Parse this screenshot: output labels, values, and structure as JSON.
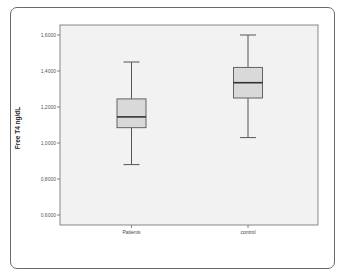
{
  "chart_data": {
    "type": "boxplot",
    "title": "",
    "xlabel": "",
    "ylabel": "Free T4 ng/dL",
    "ylim": [
      0.56,
      1.66
    ],
    "yticks": [
      0.6,
      0.8,
      1.0,
      1.2,
      1.4,
      1.6
    ],
    "ytick_labels": [
      "0,6000",
      "0,8000",
      "1,0000",
      "1,2000",
      "1,4000",
      "1,6000"
    ],
    "categories": [
      "Patients",
      "control"
    ],
    "series": [
      {
        "name": "Patients",
        "whisker_low": 0.88,
        "q1": 1.085,
        "median": 1.145,
        "q3": 1.245,
        "whisker_high": 1.45
      },
      {
        "name": "control",
        "whisker_low": 1.03,
        "q1": 1.25,
        "median": 1.335,
        "q3": 1.42,
        "whisker_high": 1.6
      }
    ],
    "grid": false,
    "legend": "none",
    "colors": {
      "box_fill": "#d9d9d9",
      "plot_bg": "#f2f2f2",
      "line": "#555555"
    }
  }
}
